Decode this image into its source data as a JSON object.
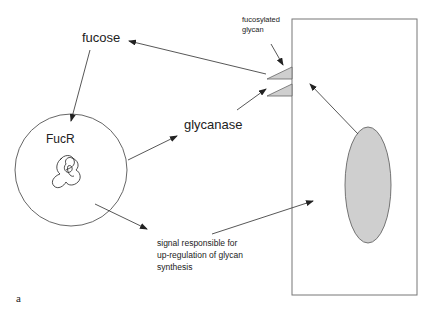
{
  "figure": {
    "panel_label": "a",
    "colors": {
      "stroke": "#444444",
      "fill_gray": "#cfcfcf",
      "text": "#222222",
      "background": "#ffffff"
    }
  },
  "labels": {
    "fucose": "fucose",
    "fucr": "FucR",
    "glycanase": "glycanase",
    "fucosylated_glycan_line1": "fucosylated",
    "fucosylated_glycan_line2": "glycan",
    "signal_line1": "signal responsible for",
    "signal_line2": "up-regulation of glycan",
    "signal_line3": "synthesis"
  },
  "nodes": [
    {
      "id": "fucr-cell",
      "shape": "circle",
      "label": "FucR"
    },
    {
      "id": "host-cell",
      "shape": "rectangle"
    },
    {
      "id": "nucleus",
      "shape": "ellipse"
    },
    {
      "id": "fucosylated-glycan-1",
      "shape": "triangle"
    },
    {
      "id": "fucosylated-glycan-2",
      "shape": "triangle"
    }
  ],
  "edges": [
    {
      "from": "fucosylated-glycan-1",
      "to": "fucose"
    },
    {
      "from": "fucose",
      "to": "fucr-cell"
    },
    {
      "from": "fucr-cell",
      "to": "glycanase"
    },
    {
      "from": "glycanase",
      "to": "fucosylated-glycan-2"
    },
    {
      "from": "fucosylated-glycan-label",
      "to": "fucosylated-glycan-1"
    },
    {
      "from": "nucleus",
      "to": "host-cell-surface"
    },
    {
      "from": "fucr-cell",
      "to": "signal"
    },
    {
      "from": "signal",
      "to": "host-cell"
    }
  ]
}
